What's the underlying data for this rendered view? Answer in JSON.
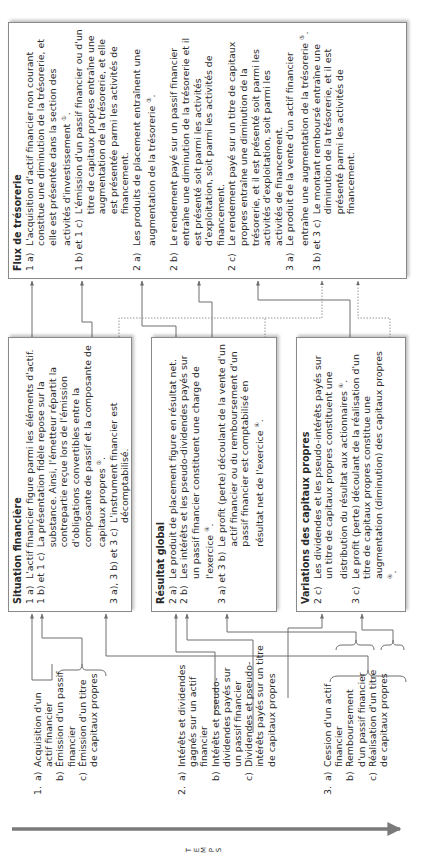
{
  "axis": {
    "label": "TEMPS",
    "letters": [
      "T",
      "E",
      "M",
      "P",
      "S"
    ]
  },
  "events": [
    {
      "num": "1.",
      "items": [
        {
          "letter": "a)",
          "lines": [
            "Acquisition d'un",
            "actif financier"
          ]
        },
        {
          "letter": "b)",
          "lines": [
            "Émission d'un passif",
            "financier"
          ]
        },
        {
          "letter": "c)",
          "lines": [
            "Émission d'un titre",
            "de capitaux propres"
          ]
        }
      ]
    },
    {
      "num": "2.",
      "items": [
        {
          "letter": "a)",
          "lines": [
            "Intérêts et dividendes",
            "gagnés sur un actif",
            "financier"
          ]
        },
        {
          "letter": "b)",
          "lines": [
            "Intérêts et pseudo-",
            "dividendes payés sur",
            "un passif financier"
          ]
        },
        {
          "letter": "c)",
          "lines": [
            "Dividendes et pseudo-",
            "intérêts payés sur un titre",
            "de capitaux propres"
          ]
        }
      ]
    },
    {
      "num": "3.",
      "items": [
        {
          "letter": "a)",
          "lines": [
            "Cession d'un actif",
            "financier"
          ]
        },
        {
          "letter": "b)",
          "lines": [
            "Remboursement",
            "d'un passif financier"
          ]
        },
        {
          "letter": "c)",
          "lines": [
            "Réalisation d'un titre",
            "de capitaux propres"
          ]
        }
      ]
    }
  ],
  "situation": {
    "title": "Situation financière",
    "entries": [
      {
        "ref": "1 a)",
        "text": "L'actif financier figure parmi les éléments d'actif."
      },
      {
        "ref": "1 b) et 1 c)",
        "text": "La présentation fidèle repose sur la substance. Ainsi, l'émetteur répartit la contrepartie reçue lors de l'émission d'obligations convertibles entre la composante de passif et la composante de capitaux propres",
        "note": "②",
        "end": "."
      },
      {
        "ref": "3 a), 3 b) et 3 c)",
        "text": "L'instrument financier est décomptabilisé."
      }
    ]
  },
  "resultat": {
    "title": "Résultat global",
    "entries": [
      {
        "ref": "2 a)",
        "text": "Le produit de placement figure en résultat net."
      },
      {
        "ref": "2 b)",
        "text": "Les intérêts et les pseudo-dividendes payés sur un passif financier constituent une charge de l'exercice",
        "note": "④",
        "end": "."
      },
      {
        "ref": "3 a) et 3 b)",
        "text": "Le profit (perte) découlant de la vente d'un actif financier ou du remboursement d'un passif financier est comptabilisé en résultat net de l'exercice",
        "note": "④",
        "end": "."
      }
    ]
  },
  "variations": {
    "title": "Variations des capitaux propres",
    "entries": [
      {
        "ref": "2 c)",
        "text": "Les dividendes et les pseudo-intérêts payés sur un titre de capitaux propres constituent une distribution du résultat aux actionnaires",
        "note": "④",
        "end": "."
      },
      {
        "ref": "3 c)",
        "text": "Le profit (perte) découlant de la réalisation d'un titre de capitaux propres constitue une augmentation (diminution) des capitaux propres",
        "note": "④",
        "end": "."
      }
    ]
  },
  "flux": {
    "title": "Flux de trésorerie",
    "entries": [
      {
        "ref": "1 a)",
        "text": "L'acquisition d'actif financier non courant constitue une diminution de la trésorerie, et elle est présentée dans la section des activités d'investissement",
        "note": "①",
        "end": "."
      },
      {
        "ref": "1 b) et 1 c)",
        "text": "L'émission d'un passif financier ou d'un titre de capitaux propres entraîne une augmentation de la trésorerie, et elle est présentée parmi les activités de financement."
      },
      {
        "ref": "2 a)",
        "text": "Les produits de placement entraînent une augmentation de la trésorerie",
        "note": "③",
        "end": "."
      },
      {
        "ref": "2 b)",
        "text": "Le rendement payé sur un passif financier entraîne une diminution de la trésorerie et il est présenté soit parmi les activités d'exploitation, soit parmi les activités de financement."
      },
      {
        "ref": "2 c)",
        "text": "Le rendement payé sur un titre de capitaux propres entraîne une diminution de la trésorerie, et il est présenté soit parmi les activités d'exploitation, soit parmi les activités de financement."
      },
      {
        "ref": "3 a)",
        "text": "Le produit de la vente d'un actif financier entraîne une augmentation de la trésorerie",
        "note": "⑤",
        "end": "."
      },
      {
        "ref": "3 b) et 3 c)",
        "text": "Le montant remboursé entraîne une diminution de la trésorerie, et il est présenté parmi les activités de financement."
      }
    ]
  },
  "colors": {
    "line": "#6e6e6e",
    "border": "#8a8a8a",
    "text": "#2a2a2a",
    "axis": "#7a7a7a"
  }
}
